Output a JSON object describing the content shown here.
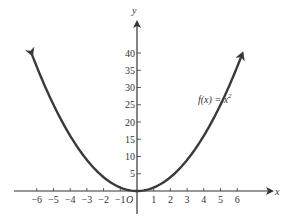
{
  "chart_data": {
    "type": "line",
    "title": "",
    "xlabel": "x",
    "ylabel": "y",
    "origin_label": "O",
    "annotation": "f(x) = x²",
    "function": "x^2",
    "xlim": [
      -6.3,
      6.3
    ],
    "ylim": [
      0,
      44
    ],
    "x_ticks": [
      -6,
      -5,
      -4,
      -3,
      -2,
      -1,
      1,
      2,
      3,
      4,
      5,
      6
    ],
    "x_tick_labels": [
      "−6",
      "−5",
      "−4",
      "−3",
      "−2",
      "−1",
      "1",
      "2",
      "3",
      "4",
      "5",
      "6"
    ],
    "y_ticks": [
      5,
      10,
      15,
      20,
      25,
      30,
      35,
      40
    ],
    "y_tick_labels": [
      "5",
      "10",
      "15",
      "20",
      "25",
      "30",
      "35",
      "40"
    ],
    "x": [
      -6.3,
      -6,
      -5,
      -4,
      -3,
      -2,
      -1,
      0,
      1,
      2,
      3,
      4,
      5,
      6,
      6.3
    ],
    "y": [
      39.69,
      36,
      25,
      16,
      9,
      4,
      1,
      0,
      1,
      4,
      9,
      16,
      25,
      36,
      39.69
    ],
    "grid": false,
    "legend": null,
    "colors": {
      "curve": "#3a3a3a",
      "axes": "#333333"
    }
  },
  "labels": {
    "x_axis": "x",
    "y_axis": "y",
    "origin": "O",
    "f_label": "f(x) = x",
    "f_exp": "2"
  }
}
